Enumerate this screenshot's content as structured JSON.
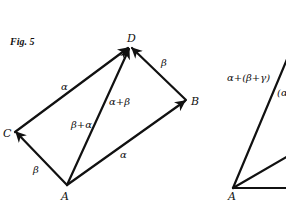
{
  "figure": {
    "caption": "Fig. 5",
    "left_diagram": {
      "points": {
        "A": {
          "label": "A",
          "x": 67,
          "y": 185
        },
        "B": {
          "label": "B",
          "x": 186,
          "y": 100
        },
        "C": {
          "label": "C",
          "x": 15,
          "y": 132
        },
        "D": {
          "label": "D",
          "x": 130,
          "y": 47
        }
      },
      "vectors": [
        {
          "from": "A",
          "to": "C",
          "label": "β"
        },
        {
          "from": "C",
          "to": "D",
          "label": "α"
        },
        {
          "from": "A",
          "to": "B",
          "label": "α"
        },
        {
          "from": "B",
          "to": "D",
          "label": "β"
        },
        {
          "from": "A",
          "to": "D",
          "label_right": "α+β",
          "label_left": "β+α"
        }
      ]
    },
    "right_diagram": {
      "points": {
        "A": {
          "label": "A",
          "x": 233,
          "y": 188
        }
      },
      "labels": {
        "long_diag": "α+(β+γ)",
        "partial": "(α"
      }
    }
  }
}
